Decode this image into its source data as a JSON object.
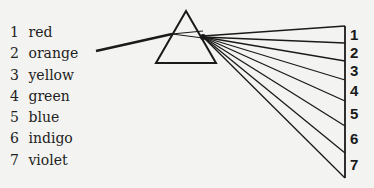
{
  "legend": {
    "items": [
      {
        "num": "1",
        "label": "red"
      },
      {
        "num": "2",
        "label": "orange"
      },
      {
        "num": "3",
        "label": "yellow"
      },
      {
        "num": "4",
        "label": "green"
      },
      {
        "num": "5",
        "label": "blue"
      },
      {
        "num": "6",
        "label": "indigo"
      },
      {
        "num": "7",
        "label": "violet"
      }
    ]
  },
  "screen": {
    "labels": [
      "1",
      "2",
      "3",
      "4",
      "5",
      "6",
      "7"
    ]
  },
  "colors": {
    "ink": "#1a1a1a",
    "paper": "#f3f3f1"
  }
}
